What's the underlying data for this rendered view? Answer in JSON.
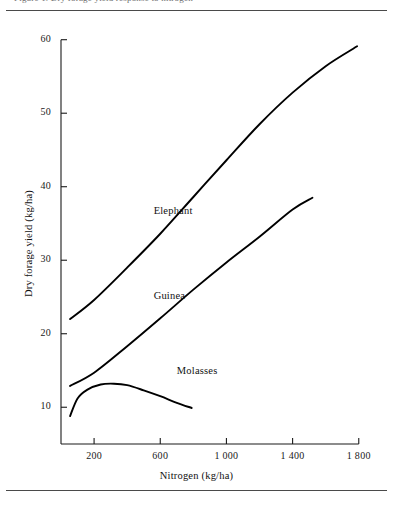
{
  "figure": {
    "clipped_caption_fragment": "Figure 1. Dry forage yield response to nitrogen"
  },
  "chart_data": {
    "type": "line",
    "title": "",
    "xlabel": "Nitrogen (kg/ha)",
    "ylabel": "Dry forage yield (kg/ha)",
    "xlim": [
      0,
      1880
    ],
    "ylim": [
      5,
      62
    ],
    "xticks": [
      200,
      600,
      1000,
      1400,
      1800
    ],
    "xticklabels": [
      "200",
      "600",
      "1 000",
      "1 400",
      "1 800"
    ],
    "yticks": [
      10,
      20,
      30,
      40,
      50,
      60
    ],
    "yticklabels": [
      "10",
      "20",
      "30",
      "40",
      "50",
      "60"
    ],
    "grid": false,
    "legend": "inline-annotations",
    "line_color": "#000000",
    "axis_color": "#1a1a1a",
    "series": [
      {
        "name": "Elephant",
        "label_x": 560,
        "label_y": 36.5,
        "x": [
          55,
          200,
          400,
          600,
          800,
          1000,
          1200,
          1400,
          1600,
          1790
        ],
        "y": [
          22.0,
          24.6,
          29.0,
          33.6,
          38.6,
          43.6,
          48.5,
          52.8,
          56.4,
          59.1
        ]
      },
      {
        "name": "Guinea",
        "label_x": 560,
        "label_y": 25.0,
        "x": [
          55,
          200,
          400,
          600,
          800,
          1000,
          1200,
          1400,
          1520
        ],
        "y": [
          12.9,
          14.7,
          18.3,
          22.1,
          26.0,
          29.7,
          33.2,
          36.9,
          38.5
        ]
      },
      {
        "name": "Molasses",
        "label_x": 700,
        "label_y": 14.8,
        "x": [
          55,
          100,
          160,
          240,
          320,
          400,
          500,
          600,
          700,
          790
        ],
        "y": [
          8.8,
          11.2,
          12.4,
          13.1,
          13.2,
          13.0,
          12.3,
          11.5,
          10.6,
          9.9
        ]
      }
    ]
  }
}
